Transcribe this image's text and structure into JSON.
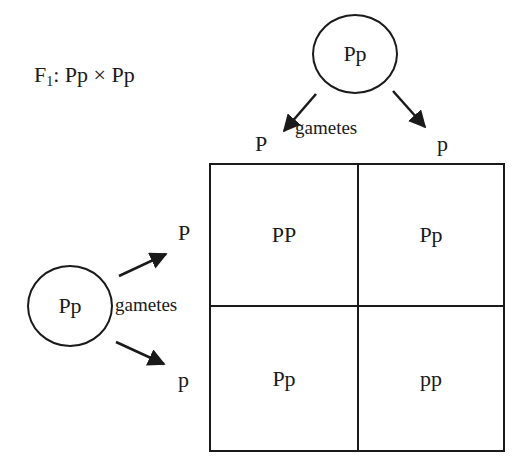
{
  "title": {
    "prefix": "F",
    "subscript": "1",
    "cross": ": Pp × Pp"
  },
  "parents": {
    "top": {
      "genotype": "Pp",
      "gametes_label": "gametes",
      "gametes": [
        "P",
        "p"
      ]
    },
    "left": {
      "genotype": "Pp",
      "gametes_label": "gametes",
      "gametes": [
        "P",
        "p"
      ]
    }
  },
  "punnett_square": {
    "columns": [
      "P",
      "p"
    ],
    "rows": [
      "P",
      "p"
    ],
    "cells": [
      [
        "PP",
        "Pp"
      ],
      [
        "Pp",
        "pp"
      ]
    ]
  },
  "colors": {
    "ink": "#1a1a1a",
    "background": "#ffffff"
  }
}
